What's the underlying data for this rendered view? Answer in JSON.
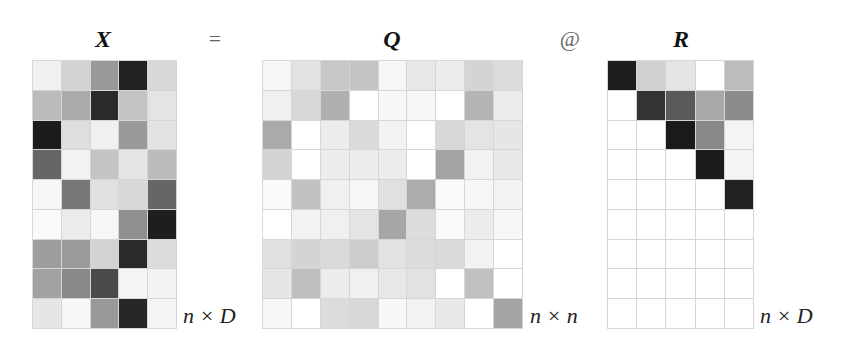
{
  "equation": {
    "lhs": "X",
    "equals": "=",
    "q_label": "Q",
    "matmul": "@",
    "r_label": "R"
  },
  "dims": {
    "x": "n × D",
    "q": "n × n",
    "r": "n × D"
  },
  "matrices": {
    "X": {
      "rows": 9,
      "cols": 5,
      "cells": [
        [
          "#f0f0f0",
          "#d2d2d2",
          "#999999",
          "#222222",
          "#d8d8d8"
        ],
        [
          "#bbbbbb",
          "#aaaaaa",
          "#2a2a2a",
          "#c4c4c4",
          "#e4e4e4"
        ],
        [
          "#1c1c1c",
          "#dedede",
          "#f0f0f0",
          "#999999",
          "#e2e2e2"
        ],
        [
          "#666666",
          "#f2f2f2",
          "#c4c4c4",
          "#e4e4e4",
          "#bbbbbb"
        ],
        [
          "#f6f6f6",
          "#777777",
          "#e0e0e0",
          "#d8d8d8",
          "#666666"
        ],
        [
          "#fafafa",
          "#ececec",
          "#f6f6f6",
          "#8f8f8f",
          "#1e1e1e"
        ],
        [
          "#9e9e9e",
          "#9a9a9a",
          "#d2d2d2",
          "#2a2a2a",
          "#dcdcdc"
        ],
        [
          "#a2a2a2",
          "#888888",
          "#4a4a4a",
          "#f4f4f4",
          "#f2f2f2"
        ],
        [
          "#e6e6e6",
          "#f6f6f6",
          "#999999",
          "#262626",
          "#f4f4f4"
        ]
      ]
    },
    "Q": {
      "rows": 9,
      "cols": 9,
      "cells": [
        [
          "#f6f6f6",
          "#e2e2e2",
          "#c8c8c8",
          "#c4c4c4",
          "#f6f6f6",
          "#e8e8e8",
          "#ececec",
          "#d4d4d4",
          "#dcdcdc"
        ],
        [
          "#f0f0f0",
          "#d8d8d8",
          "#b0b0b0",
          "#ffffff",
          "#f8f8f8",
          "#f6f6f6",
          "#ffffff",
          "#b4b4b4",
          "#ececec"
        ],
        [
          "#aaaaaa",
          "#ffffff",
          "#ececec",
          "#dadada",
          "#f2f2f2",
          "#ffffff",
          "#d8d8d8",
          "#e4e4e4",
          "#e6e6e6"
        ],
        [
          "#d4d4d4",
          "#ffffff",
          "#ececec",
          "#ececec",
          "#ececec",
          "#ffffff",
          "#a4a4a4",
          "#f2f2f2",
          "#e8e8e8"
        ],
        [
          "#fafafa",
          "#c2c2c2",
          "#f0f0f0",
          "#f6f6f6",
          "#e0e0e0",
          "#acacac",
          "#fafafa",
          "#f6f6f6",
          "#f2f2f2"
        ],
        [
          "#ffffff",
          "#f2f2f2",
          "#f0f0f0",
          "#e4e4e4",
          "#a6a6a6",
          "#dcdcdc",
          "#fafafa",
          "#ececec",
          "#f6f6f6"
        ],
        [
          "#e0e0e0",
          "#d4d4d4",
          "#dadada",
          "#cccccc",
          "#e2e2e2",
          "#dcdcdc",
          "#dadada",
          "#f2f2f2",
          "#ffffff"
        ],
        [
          "#e6e6e6",
          "#bebebe",
          "#ececec",
          "#f0f0f0",
          "#e8e8e8",
          "#e2e2e2",
          "#ffffff",
          "#c0c0c0",
          "#ffffff"
        ],
        [
          "#f6f6f6",
          "#ffffff",
          "#dcdcdc",
          "#d8d8d8",
          "#f8f8f8",
          "#f2f2f2",
          "#e8e8e8",
          "#ffffff",
          "#a4a4a4"
        ]
      ]
    },
    "R": {
      "rows": 9,
      "cols": 5,
      "cells": [
        [
          "#1e1e1e",
          "#d0d0d0",
          "#e4e4e4",
          "#ffffff",
          "#bcbcbc"
        ],
        [
          "#ffffff",
          "#333333",
          "#5a5a5a",
          "#a8a8a8",
          "#8c8c8c"
        ],
        [
          "#ffffff",
          "#ffffff",
          "#1a1a1a",
          "#888888",
          "#f4f4f4"
        ],
        [
          "#ffffff",
          "#ffffff",
          "#ffffff",
          "#1c1c1c",
          "#f4f4f4"
        ],
        [
          "#ffffff",
          "#ffffff",
          "#ffffff",
          "#ffffff",
          "#222222"
        ],
        [
          "#ffffff",
          "#ffffff",
          "#ffffff",
          "#ffffff",
          "#ffffff"
        ],
        [
          "#ffffff",
          "#ffffff",
          "#ffffff",
          "#ffffff",
          "#ffffff"
        ],
        [
          "#ffffff",
          "#ffffff",
          "#ffffff",
          "#ffffff",
          "#ffffff"
        ],
        [
          "#ffffff",
          "#ffffff",
          "#ffffff",
          "#ffffff",
          "#ffffff"
        ]
      ]
    }
  }
}
